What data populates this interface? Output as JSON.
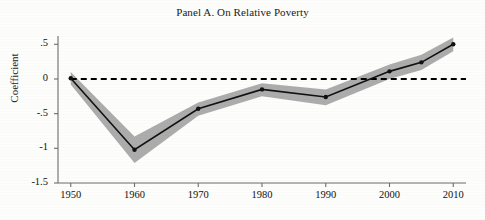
{
  "chart_data": {
    "type": "line",
    "title": "Panel A. On Relative Poverty",
    "xlabel": "",
    "ylabel": "Coefficient",
    "xlim": [
      1948,
      2012
    ],
    "ylim": [
      -1.5,
      0.62
    ],
    "grid": false,
    "legend": "none",
    "x": [
      1950,
      1960,
      1970,
      1980,
      1990,
      2000,
      2005,
      2010
    ],
    "xticks": [
      "1950",
      "1960",
      "1970",
      "1980",
      "1990",
      "2000",
      "2010"
    ],
    "xtick_values": [
      1950,
      1960,
      1970,
      1980,
      1990,
      2000,
      2010
    ],
    "yticks": [
      ".5",
      "0",
      "-.5",
      "-1",
      "-1.5"
    ],
    "ytick_values": [
      0.5,
      0,
      -0.5,
      -1,
      -1.5
    ],
    "series": [
      {
        "name": "Coefficient",
        "values": [
          0.01,
          -1.02,
          -0.43,
          -0.15,
          -0.26,
          0.11,
          0.24,
          0.5
        ],
        "marker": "dot",
        "color": "#111111"
      }
    ],
    "confidence_band": {
      "name": "Confidence interval",
      "color": "#a8a8a8",
      "upper": [
        0.1,
        -0.83,
        -0.34,
        -0.06,
        -0.15,
        0.21,
        0.35,
        0.6
      ],
      "lower": [
        -0.08,
        -1.21,
        -0.53,
        -0.25,
        -0.38,
        0.0,
        0.13,
        0.4
      ]
    },
    "reference_line": {
      "name": "zero-line",
      "value": 0,
      "style": "dashed",
      "color": "#000000"
    },
    "annotations": []
  }
}
